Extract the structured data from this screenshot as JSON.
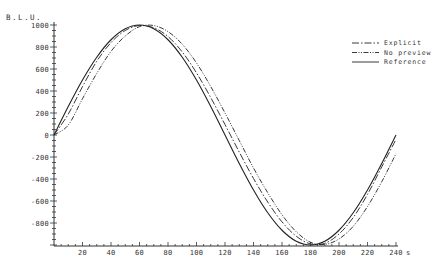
{
  "chart_data": {
    "type": "line",
    "title": "",
    "xlabel": "s",
    "ylabel": "B.L.U.",
    "xlim": [
      0,
      240
    ],
    "ylim": [
      -1000,
      1000
    ],
    "x_ticks": [
      20,
      40,
      60,
      80,
      100,
      120,
      140,
      160,
      180,
      200,
      220,
      240
    ],
    "x_tick_labels": [
      "20",
      "40",
      "60",
      "80",
      "100",
      "120",
      "140",
      "160",
      "180",
      "200",
      "220",
      "240"
    ],
    "x_unit_label": "s",
    "y_ticks": [
      1000,
      800,
      600,
      400,
      200,
      0,
      -200,
      -400,
      -600,
      -800
    ],
    "y_tick_labels": [
      "1000",
      "800",
      "600",
      "400",
      "200",
      "0",
      "-200",
      "-400",
      "-600",
      "-800"
    ],
    "grid": false,
    "legend_position": "upper right",
    "x": [
      0,
      10,
      20,
      30,
      40,
      50,
      60,
      70,
      80,
      90,
      100,
      110,
      120,
      130,
      140,
      150,
      160,
      170,
      180,
      190,
      200,
      210,
      220,
      230,
      240
    ],
    "series": [
      {
        "name": "Explicit",
        "style": "dash-dot",
        "values": [
          0,
          190,
          440,
          670,
          840,
          950,
          995,
          975,
          895,
          755,
          565,
          340,
          95,
          -155,
          -395,
          -610,
          -790,
          -920,
          -990,
          -985,
          -900,
          -750,
          -540,
          -290,
          -40
        ]
      },
      {
        "name": "No preview",
        "style": "dash-dot-dot",
        "values": [
          0,
          90,
          330,
          560,
          760,
          900,
          985,
          995,
          940,
          825,
          655,
          440,
          200,
          -50,
          -300,
          -525,
          -725,
          -880,
          -975,
          -995,
          -945,
          -830,
          -650,
          -425,
          -170
        ]
      },
      {
        "name": "Reference",
        "style": "solid",
        "values": [
          0,
          259,
          500,
          707,
          866,
          966,
          1000,
          966,
          866,
          707,
          500,
          259,
          0,
          -259,
          -500,
          -707,
          -866,
          -966,
          -1000,
          -966,
          -866,
          -707,
          -500,
          -259,
          0
        ]
      }
    ]
  },
  "legend": {
    "items": [
      {
        "label": "Explicit"
      },
      {
        "label": "No preview"
      },
      {
        "label": "Reference"
      }
    ]
  },
  "axes": {
    "ylabel": "B.L.U.",
    "x_end_label": "240 1s"
  }
}
